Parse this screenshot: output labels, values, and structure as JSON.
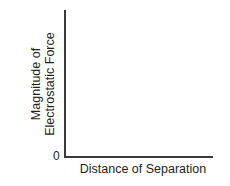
{
  "chart_data": {
    "type": "line",
    "title": "",
    "xlabel": "Distance of Separation",
    "ylabel_lines": [
      "Magnitude of",
      "Electrostatic Force"
    ],
    "ylabel": "Magnitude of Electrostatic Force",
    "origin_label": "0",
    "x": [],
    "series": [],
    "grid": false,
    "legend": null
  }
}
